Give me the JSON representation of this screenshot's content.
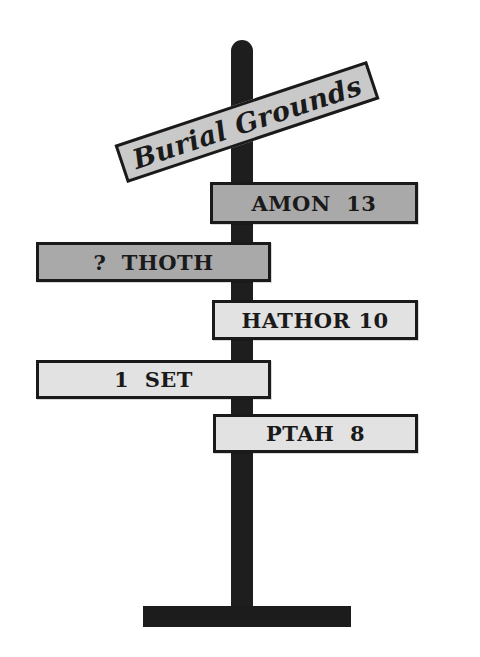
{
  "signpost": {
    "header": {
      "label": "Burial Grounds",
      "fill": "#c9c9c9",
      "angle_deg": -18.4
    },
    "signs": [
      {
        "label": "AMON  13",
        "name": "AMON",
        "value": "13",
        "side": "right",
        "shade": "dark",
        "fill": "#a9a9a9"
      },
      {
        "label": "?  THOTH",
        "name": "THOTH",
        "value": "?",
        "side": "left",
        "shade": "dark",
        "fill": "#a9a9a9"
      },
      {
        "label": "HATHOR 10",
        "name": "HATHOR",
        "value": "10",
        "side": "right",
        "shade": "light",
        "fill": "#e2e2e2"
      },
      {
        "label": "1  SET",
        "name": "SET",
        "value": "1",
        "side": "left",
        "shade": "light",
        "fill": "#e2e2e2"
      },
      {
        "label": "PTAH  8",
        "name": "PTAH",
        "value": "8",
        "side": "right",
        "shade": "light",
        "fill": "#e2e2e2"
      }
    ],
    "colors": {
      "pole": "#1e1e1e",
      "border": "#1a1a1a",
      "background": "#ffffff"
    }
  }
}
